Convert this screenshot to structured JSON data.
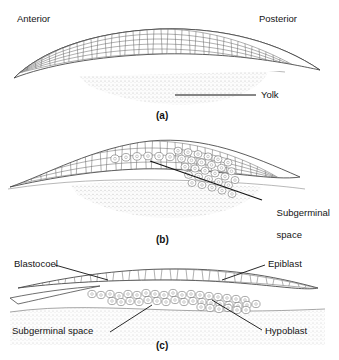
{
  "figure": {
    "orientation": {
      "anterior": "Anterior",
      "posterior": "Posterior"
    },
    "ink_color": "#3a3a3a",
    "yolk_color": "#b9b9b9",
    "label_color": "#141414"
  },
  "panels": [
    {
      "id": "a",
      "caption": "(a)",
      "labels": [
        {
          "name": "yolk",
          "text": "Yolk"
        }
      ]
    },
    {
      "id": "b",
      "caption": "(b)",
      "labels": [
        {
          "name": "subgerminal-space",
          "text": "Subgerminal",
          "text2": "space"
        }
      ]
    },
    {
      "id": "c",
      "caption": "(c)",
      "labels": [
        {
          "name": "blastocoel",
          "text": "Blastocoel"
        },
        {
          "name": "epiblast",
          "text": "Epiblast"
        },
        {
          "name": "subgerminal-space",
          "text": "Subgerminal space"
        },
        {
          "name": "hypoblast",
          "text": "Hypoblast"
        }
      ]
    }
  ]
}
